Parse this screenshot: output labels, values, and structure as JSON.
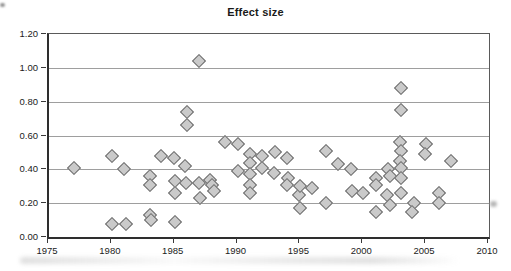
{
  "chart_data": {
    "type": "scatter",
    "title": "Effect size",
    "xlabel": "",
    "ylabel": "",
    "xlim": [
      1975,
      2010
    ],
    "ylim": [
      0.0,
      1.2
    ],
    "x_ticks": [
      1975,
      1980,
      1985,
      1990,
      1995,
      2000,
      2005,
      2010
    ],
    "y_ticks": [
      "1.20",
      "1.00",
      "0.80",
      "0.60",
      "0.40",
      "0.20",
      "0.00"
    ],
    "grid": "horizontal-only",
    "legend": "none",
    "marker": "diamond",
    "marker_fill": "#cacaca",
    "marker_stroke": "#6b6b6b",
    "points": [
      [
        1977.0,
        0.41
      ],
      [
        1980.0,
        0.48
      ],
      [
        1980.0,
        0.08
      ],
      [
        1981.0,
        0.4
      ],
      [
        1981.1,
        0.08
      ],
      [
        1983.0,
        0.36
      ],
      [
        1983.0,
        0.31
      ],
      [
        1983.0,
        0.13
      ],
      [
        1983.1,
        0.1
      ],
      [
        1983.9,
        0.48
      ],
      [
        1984.9,
        0.47
      ],
      [
        1985.0,
        0.33
      ],
      [
        1985.0,
        0.26
      ],
      [
        1985.0,
        0.09
      ],
      [
        1985.8,
        0.42
      ],
      [
        1985.9,
        0.32
      ],
      [
        1986.0,
        0.74
      ],
      [
        1986.0,
        0.66
      ],
      [
        1986.9,
        1.04
      ],
      [
        1986.9,
        0.32
      ],
      [
        1987.0,
        0.23
      ],
      [
        1987.8,
        0.34
      ],
      [
        1988.0,
        0.31
      ],
      [
        1988.1,
        0.27
      ],
      [
        1989.0,
        0.56
      ],
      [
        1990.0,
        0.55
      ],
      [
        1990.0,
        0.39
      ],
      [
        1991.0,
        0.49
      ],
      [
        1991.0,
        0.44
      ],
      [
        1991.0,
        0.37
      ],
      [
        1991.0,
        0.31
      ],
      [
        1991.0,
        0.26
      ],
      [
        1991.9,
        0.48
      ],
      [
        1991.9,
        0.41
      ],
      [
        1992.9,
        0.38
      ],
      [
        1993.0,
        0.5
      ],
      [
        1993.9,
        0.47
      ],
      [
        1994.0,
        0.35
      ],
      [
        1993.9,
        0.31
      ],
      [
        1994.9,
        0.25
      ],
      [
        1995.0,
        0.3
      ],
      [
        1995.0,
        0.17
      ],
      [
        1995.9,
        0.29
      ],
      [
        1997.0,
        0.51
      ],
      [
        1997.0,
        0.2
      ],
      [
        1998.0,
        0.43
      ],
      [
        1999.0,
        0.4
      ],
      [
        1999.1,
        0.27
      ],
      [
        2000.0,
        0.26
      ],
      [
        2001.0,
        0.35
      ],
      [
        2001.0,
        0.31
      ],
      [
        2001.0,
        0.15
      ],
      [
        2002.0,
        0.4
      ],
      [
        2002.1,
        0.36
      ],
      [
        2001.9,
        0.25
      ],
      [
        2002.1,
        0.19
      ],
      [
        2003.0,
        0.88
      ],
      [
        2003.0,
        0.75
      ],
      [
        2002.9,
        0.56
      ],
      [
        2003.0,
        0.51
      ],
      [
        2002.9,
        0.45
      ],
      [
        2003.0,
        0.41
      ],
      [
        2003.0,
        0.35
      ],
      [
        2003.0,
        0.26
      ],
      [
        2004.0,
        0.2
      ],
      [
        2003.9,
        0.15
      ],
      [
        2005.0,
        0.55
      ],
      [
        2004.9,
        0.49
      ],
      [
        2006.0,
        0.26
      ],
      [
        2006.0,
        0.2
      ],
      [
        2007.0,
        0.45
      ]
    ]
  }
}
